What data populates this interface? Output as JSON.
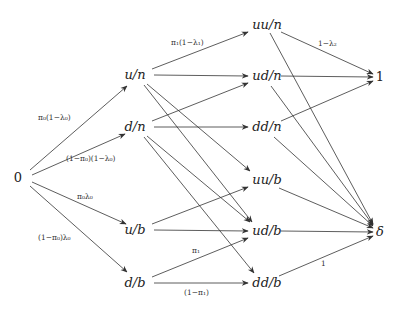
{
  "nodes": [
    {
      "id": "n0",
      "label": "0",
      "x": 22,
      "y": 178,
      "anchor": "end"
    },
    {
      "id": "un",
      "label": "u/n",
      "x": 135,
      "y": 75
    },
    {
      "id": "dn",
      "label": "d/n",
      "x": 135,
      "y": 127
    },
    {
      "id": "ub",
      "label": "u/b",
      "x": 135,
      "y": 230
    },
    {
      "id": "db",
      "label": "d/b",
      "x": 135,
      "y": 283
    },
    {
      "id": "uun",
      "label": "uu/n",
      "x": 267,
      "y": 25
    },
    {
      "id": "udn",
      "label": "ud/n",
      "x": 267,
      "y": 76
    },
    {
      "id": "ddn",
      "label": "dd/n",
      "x": 267,
      "y": 127
    },
    {
      "id": "uub",
      "label": "uu/b",
      "x": 267,
      "y": 180
    },
    {
      "id": "udb",
      "label": "ud/b",
      "x": 267,
      "y": 231
    },
    {
      "id": "ddb",
      "label": "dd/b",
      "x": 267,
      "y": 283
    },
    {
      "id": "one",
      "label": "1",
      "x": 380,
      "y": 77
    },
    {
      "id": "delta",
      "label": "δ",
      "x": 380,
      "y": 232
    }
  ],
  "edges": [
    {
      "from": "n0",
      "to": "un",
      "x1": 30,
      "y1": 170,
      "x2": 127,
      "y2": 86,
      "label": "π₀(1−λ₀)",
      "lx": 38,
      "ly": 120
    },
    {
      "from": "n0",
      "to": "dn",
      "x1": 32,
      "y1": 175,
      "x2": 125,
      "y2": 134,
      "label": "(1−π₀)(1−λ₀)",
      "lx": 66,
      "ly": 161
    },
    {
      "from": "n0",
      "to": "ub",
      "x1": 32,
      "y1": 182,
      "x2": 126,
      "y2": 224,
      "label": "π₀λ₀",
      "lx": 77,
      "ly": 199
    },
    {
      "from": "n0",
      "to": "db",
      "x1": 30,
      "y1": 186,
      "x2": 127,
      "y2": 272,
      "label": "(1−π₀)λ₀",
      "lx": 38,
      "ly": 240
    },
    {
      "from": "un",
      "to": "uun",
      "x1": 152,
      "y1": 69,
      "x2": 248,
      "y2": 32,
      "label": "π₁(1−λ₁)",
      "lx": 171,
      "ly": 45
    },
    {
      "from": "un",
      "to": "udn",
      "x1": 154,
      "y1": 75,
      "x2": 248,
      "y2": 76,
      "label": "",
      "lx": 0,
      "ly": 0
    },
    {
      "from": "un",
      "to": "uub",
      "x1": 147,
      "y1": 84,
      "x2": 250,
      "y2": 171,
      "label": "",
      "lx": 0,
      "ly": 0
    },
    {
      "from": "un",
      "to": "udb",
      "x1": 144,
      "y1": 85,
      "x2": 252,
      "y2": 222,
      "label": "",
      "lx": 0,
      "ly": 0
    },
    {
      "from": "dn",
      "to": "udn",
      "x1": 152,
      "y1": 121,
      "x2": 248,
      "y2": 83,
      "label": "",
      "lx": 0,
      "ly": 0
    },
    {
      "from": "dn",
      "to": "ddn",
      "x1": 154,
      "y1": 127,
      "x2": 248,
      "y2": 127,
      "label": "",
      "lx": 0,
      "ly": 0
    },
    {
      "from": "dn",
      "to": "udb",
      "x1": 147,
      "y1": 136,
      "x2": 250,
      "y2": 222,
      "label": "",
      "lx": 0,
      "ly": 0
    },
    {
      "from": "dn",
      "to": "ddb",
      "x1": 144,
      "y1": 137,
      "x2": 254,
      "y2": 273,
      "label": "",
      "lx": 0,
      "ly": 0
    },
    {
      "from": "ub",
      "to": "uub",
      "x1": 152,
      "y1": 224,
      "x2": 248,
      "y2": 187,
      "label": "",
      "lx": 0,
      "ly": 0
    },
    {
      "from": "ub",
      "to": "udb",
      "x1": 154,
      "y1": 230,
      "x2": 248,
      "y2": 231,
      "label": "",
      "lx": 0,
      "ly": 0
    },
    {
      "from": "db",
      "to": "udb",
      "x1": 152,
      "y1": 277,
      "x2": 248,
      "y2": 238,
      "label": "π₁",
      "lx": 192,
      "ly": 253
    },
    {
      "from": "db",
      "to": "ddb",
      "x1": 154,
      "y1": 283,
      "x2": 248,
      "y2": 283,
      "label": "(1−π₁)",
      "lx": 184,
      "ly": 295
    },
    {
      "from": "uun",
      "to": "one",
      "x1": 281,
      "y1": 32,
      "x2": 373,
      "y2": 74,
      "label": "1−λ₂",
      "lx": 318,
      "ly": 46
    },
    {
      "from": "udn",
      "to": "one",
      "x1": 281,
      "y1": 76,
      "x2": 373,
      "y2": 77,
      "label": "",
      "lx": 0,
      "ly": 0
    },
    {
      "from": "ddn",
      "to": "one",
      "x1": 281,
      "y1": 121,
      "x2": 373,
      "y2": 81,
      "label": "",
      "lx": 0,
      "ly": 0
    },
    {
      "from": "uun",
      "to": "delta",
      "x1": 270,
      "y1": 33,
      "x2": 373,
      "y2": 224,
      "label": "",
      "lx": 0,
      "ly": 0
    },
    {
      "from": "udn",
      "to": "delta",
      "x1": 271,
      "y1": 86,
      "x2": 373,
      "y2": 225,
      "label": "",
      "lx": 0,
      "ly": 0
    },
    {
      "from": "ddn",
      "to": "delta",
      "x1": 274,
      "y1": 137,
      "x2": 373,
      "y2": 226,
      "label": "",
      "lx": 0,
      "ly": 0
    },
    {
      "from": "uub",
      "to": "delta",
      "x1": 279,
      "y1": 188,
      "x2": 373,
      "y2": 228,
      "label": "",
      "lx": 0,
      "ly": 0
    },
    {
      "from": "udb",
      "to": "delta",
      "x1": 281,
      "y1": 231,
      "x2": 373,
      "y2": 232,
      "label": "",
      "lx": 0,
      "ly": 0
    },
    {
      "from": "ddb",
      "to": "delta",
      "x1": 279,
      "y1": 276,
      "x2": 373,
      "y2": 236,
      "label": "1",
      "lx": 321,
      "ly": 266
    }
  ]
}
